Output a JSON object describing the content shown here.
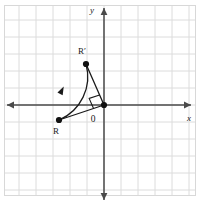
{
  "figure": {
    "width": 200,
    "height": 208,
    "background_color": "#ffffff",
    "border_color": "#d8d8d8",
    "grid": {
      "color": "#dcdcdc",
      "spacing_px": 17,
      "visible": true
    },
    "axes": {
      "color": "#4a4a4a",
      "origin_px": {
        "x": 104,
        "y": 105
      },
      "x_axis": {
        "label": "x",
        "label_pos": {
          "x": 189,
          "y": 121
        },
        "start_px": {
          "x": 7,
          "y": 105
        },
        "end_px": {
          "x": 191,
          "y": 105
        },
        "arrow_start": true,
        "arrow_end": true
      },
      "y_axis": {
        "label": "y",
        "label_pos": {
          "x": 92,
          "y": 13
        },
        "start_px": {
          "x": 104,
          "y": 200
        },
        "end_px": {
          "x": 104,
          "y": 8
        },
        "arrow_start": true,
        "arrow_end": true
      }
    },
    "origin_marker": {
      "label": "0",
      "label_pos": {
        "x": 93,
        "y": 122
      },
      "dot_px": {
        "x": 104,
        "y": 105
      },
      "dot_radius": 3.1,
      "dot_color": "#111111"
    },
    "points": [
      {
        "name": "R",
        "label": "R",
        "pos_px": {
          "x": 59,
          "y": 120
        },
        "label_pos": {
          "x": 56,
          "y": 134
        },
        "dot_radius": 3.1,
        "dot_color": "#111111"
      },
      {
        "name": "R-prime",
        "label": "R′",
        "pos_px": {
          "x": 86,
          "y": 64
        },
        "label_pos": {
          "x": 82,
          "y": 54
        },
        "dot_radius": 3.1,
        "dot_color": "#111111"
      }
    ],
    "segments": [
      {
        "name": "origin-to-R",
        "from": {
          "x": 104,
          "y": 105
        },
        "to": {
          "x": 59,
          "y": 120
        },
        "color": "#1a1a1a",
        "width": 1.3
      },
      {
        "name": "origin-to-R-prime",
        "from": {
          "x": 104,
          "y": 105
        },
        "to": {
          "x": 86,
          "y": 64
        },
        "color": "#1a1a1a",
        "width": 1.3
      }
    ],
    "arc": {
      "name": "rotation-arc",
      "from": {
        "x": 59,
        "y": 120
      },
      "to": {
        "x": 86,
        "y": 64
      },
      "radius": 47,
      "sweep": "counterclockwise",
      "color": "#1a1a1a",
      "width": 1.3,
      "direction_arrow_at": {
        "x": 61.5,
        "y": 91
      },
      "direction_arrow_angle_deg": -63
    },
    "right_angle_marker": {
      "name": "right-angle-at-origin",
      "vertex": {
        "x": 104,
        "y": 105
      },
      "size_px": 11,
      "color": "#1a1a1a",
      "indicates": "90 degree rotation"
    }
  }
}
